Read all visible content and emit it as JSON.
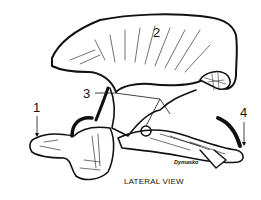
{
  "diagram": {
    "view_caption": "LATERAL VIEW",
    "artist_signature": "Dymasko",
    "labels": [
      {
        "id": "1",
        "text": "1"
      },
      {
        "id": "2",
        "text": "2"
      },
      {
        "id": "3",
        "text": "3"
      },
      {
        "id": "4",
        "text": "4"
      }
    ],
    "colors": {
      "ink": "#111111",
      "background": "#ffffff"
    }
  }
}
